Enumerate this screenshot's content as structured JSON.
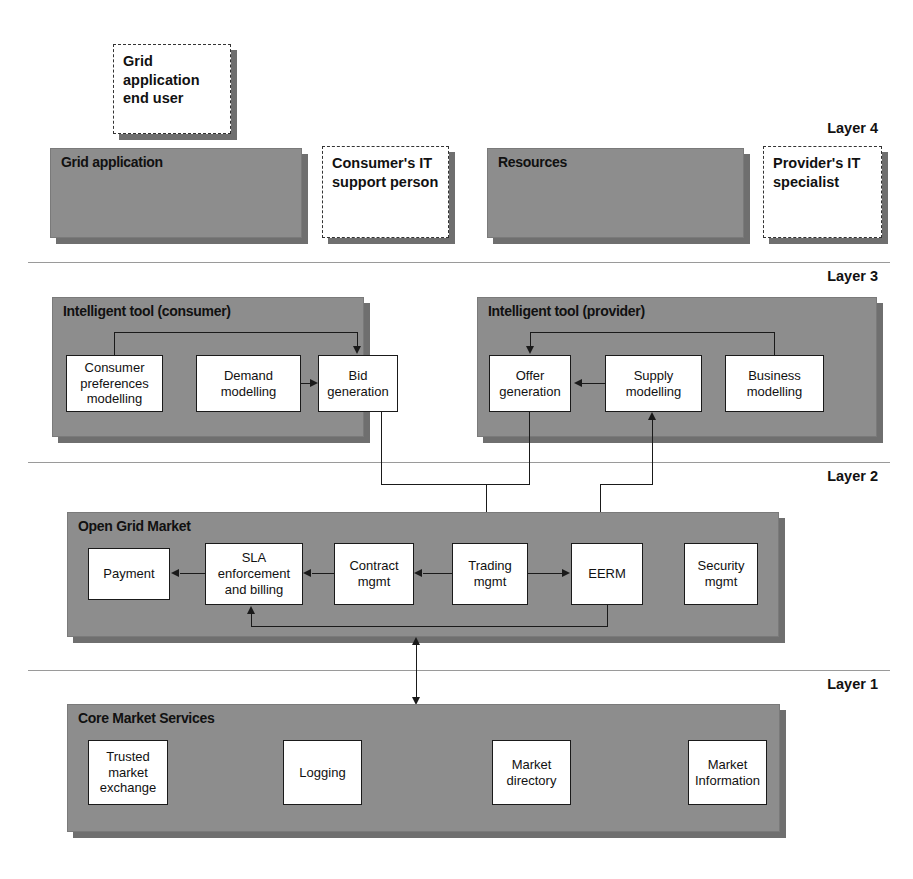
{
  "diagram": {
    "colors": {
      "panel_fill": "#8d8d8d",
      "panel_shadow": "#6f6f6f",
      "node_fill": "#ffffff",
      "line": "#1a1a1a",
      "separator": "#9a9a9a",
      "text": "#111111"
    }
  },
  "layer_labels": {
    "layer4": "Layer 4",
    "layer3": "Layer 3",
    "layer2": "Layer 2",
    "layer1": "Layer 1"
  },
  "actors": {
    "end_user": "Grid application end user",
    "consumer_it": "Consumer's IT support person",
    "provider_it": "Provider's IT specialist"
  },
  "layer4": {
    "grid_application": "Grid application",
    "resources": "Resources"
  },
  "layer3": {
    "consumer_tool_title": "Intelligent tool (consumer)",
    "provider_tool_title": "Intelligent tool (provider)",
    "consumer_nodes": [
      "Consumer preferences modelling",
      "Demand modelling",
      "Bid generation"
    ],
    "provider_nodes": [
      "Offer generation",
      "Supply modelling",
      "Business modelling"
    ]
  },
  "layer2": {
    "title": "Open Grid Market",
    "nodes": [
      "Payment",
      "SLA enforcement and billing",
      "Contract mgmt",
      "Trading mgmt",
      "EERM",
      "Security mgmt"
    ]
  },
  "layer1": {
    "title": "Core Market Services",
    "nodes": [
      "Trusted market exchange",
      "Logging",
      "Market directory",
      "Market Information"
    ]
  }
}
